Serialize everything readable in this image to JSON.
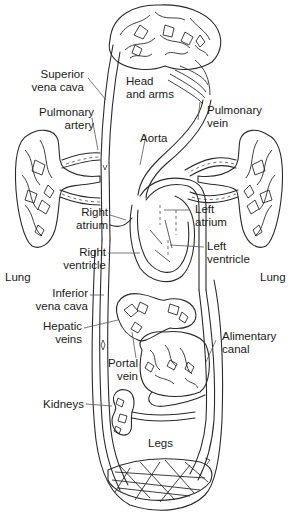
{
  "figure": {
    "background": "#ffffff",
    "line_color": "#2a2a2a"
  },
  "labels": {
    "superior_vena_cava": [
      "Superior",
      "vena cava"
    ],
    "head_and_arms": [
      "Head",
      "and arms"
    ],
    "pulmonary_artery": [
      "Pulmonary",
      "artery"
    ],
    "pulmonary_vein": [
      "Pulmonary",
      "vein"
    ],
    "aorta": "Aorta",
    "right_atrium": [
      "Right",
      "atrium"
    ],
    "left_atrium": [
      "Left",
      "atrium"
    ],
    "right_ventricle": [
      "Right",
      "ventricle"
    ],
    "left_ventricle": [
      "Left",
      "ventricle"
    ],
    "lung_left": "Lung",
    "lung_right": "Lung",
    "inferior_vena_cava": [
      "Inferior",
      "vena cava"
    ],
    "hepatic_veins": [
      "Hepatic",
      "veins"
    ],
    "alimentary_canal": [
      "Alimentary",
      "canal"
    ],
    "portal_vein": [
      "Portal",
      "vein"
    ],
    "kidneys": "Kidneys",
    "legs": "Legs"
  }
}
